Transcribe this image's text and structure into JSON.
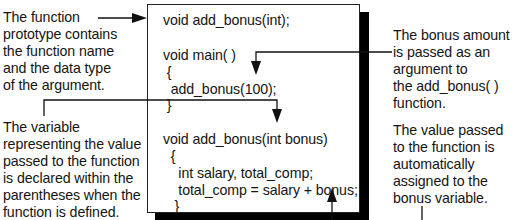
{
  "callouts": {
    "prototype": "The function\nprototype contains\nthe function name\nand the data type\nof the argument.",
    "variable": "The variable\nrepresenting the value\npassed to the function\nis declared within the\nparentheses when the\nfunction is defined.",
    "bonus_amount": "The bonus amount\nis passed as an\nargument to\nthe add_bonus( )\nfunction.",
    "value_passed": "The value passed\nto the function is\nautomatically\nassigned to the\nbonus variable."
  },
  "code": {
    "lines": [
      "void add_bonus(int);",
      "void main( )",
      " {",
      "  add_bonus(100);",
      " }",
      "void add_bonus(int bonus)",
      "  {",
      "    int salary, total_comp;",
      "    total_comp = salary + bonus;",
      "   }"
    ]
  },
  "colors": {
    "ink": "#141414",
    "shadow": "#000000",
    "background": "#ffffff"
  }
}
